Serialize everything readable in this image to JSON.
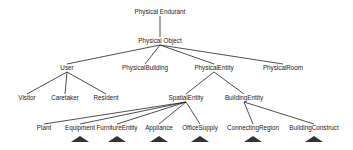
{
  "diagram": {
    "type": "tree",
    "nodes": [
      {
        "id": "physical_endurant",
        "label": "Physical Endurant",
        "x": 160,
        "y": 12
      },
      {
        "id": "physical_object",
        "label": "Physical Object",
        "x": 160,
        "y": 41
      },
      {
        "id": "user",
        "label": "User",
        "x": 67,
        "y": 68
      },
      {
        "id": "physical_building",
        "label": "PhysicalBuilding",
        "x": 145,
        "y": 68
      },
      {
        "id": "physical_entity",
        "label": "PhysicalEntity",
        "x": 214,
        "y": 68
      },
      {
        "id": "physical_room",
        "label": "PhysicalRoom",
        "x": 283,
        "y": 68
      },
      {
        "id": "visitor",
        "label": "Visitor",
        "x": 27,
        "y": 98
      },
      {
        "id": "caretaker",
        "label": "Caretaker",
        "x": 65,
        "y": 98
      },
      {
        "id": "resident",
        "label": "Resident",
        "x": 106,
        "y": 98
      },
      {
        "id": "spatial_entity",
        "label": "SpatialEntity",
        "x": 186,
        "y": 98
      },
      {
        "id": "building_entity",
        "label": "BuildingEntity",
        "x": 244,
        "y": 98
      },
      {
        "id": "plant",
        "label": "Plant",
        "x": 44,
        "y": 128
      },
      {
        "id": "equipment",
        "label": "Equipment",
        "x": 80,
        "y": 128
      },
      {
        "id": "furniture_entity",
        "label": "FurnitureEntity",
        "x": 117,
        "y": 128
      },
      {
        "id": "appliance",
        "label": "Appliance",
        "x": 159,
        "y": 128
      },
      {
        "id": "office_supply",
        "label": "OfficeSupply",
        "x": 200,
        "y": 128
      },
      {
        "id": "connecting_region",
        "label": "ConnectingRegion",
        "x": 253,
        "y": 128
      },
      {
        "id": "building_construct",
        "label": "BuildingConstruct",
        "x": 314,
        "y": 128
      }
    ],
    "edges": [
      [
        "physical_endurant",
        "physical_object"
      ],
      [
        "physical_object",
        "user"
      ],
      [
        "physical_object",
        "physical_building"
      ],
      [
        "physical_object",
        "physical_entity"
      ],
      [
        "physical_object",
        "physical_room"
      ],
      [
        "user",
        "visitor"
      ],
      [
        "user",
        "caretaker"
      ],
      [
        "user",
        "resident"
      ],
      [
        "physical_entity",
        "spatial_entity"
      ],
      [
        "physical_entity",
        "building_entity"
      ],
      [
        "spatial_entity",
        "plant"
      ],
      [
        "spatial_entity",
        "equipment"
      ],
      [
        "spatial_entity",
        "furniture_entity"
      ],
      [
        "spatial_entity",
        "appliance"
      ],
      [
        "spatial_entity",
        "office_supply"
      ],
      [
        "building_entity",
        "connecting_region"
      ],
      [
        "building_entity",
        "building_construct"
      ]
    ],
    "collapsed_subtrees": [
      "equipment",
      "furniture_entity",
      "appliance",
      "office_supply",
      "connecting_region",
      "building_construct"
    ],
    "colors": {
      "line": "#222222",
      "text": "#222222",
      "triangle": "#333333",
      "background": "#ffffff"
    }
  }
}
